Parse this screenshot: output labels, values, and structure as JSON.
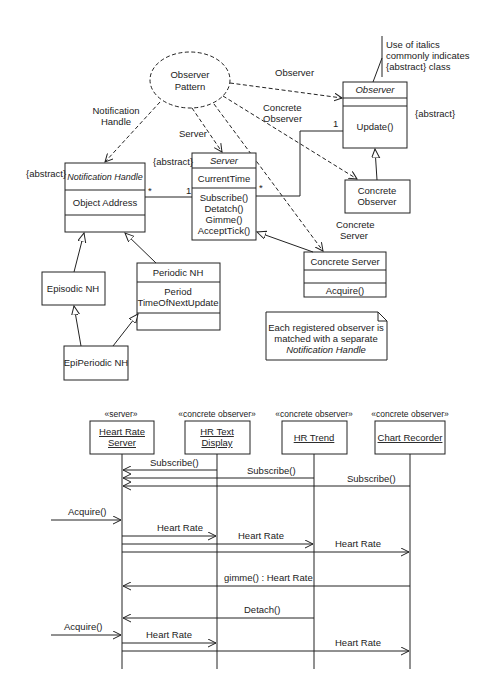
{
  "class_diagram": {
    "collaboration": {
      "label_line1": "Observer",
      "label_line2": "Pattern"
    },
    "role_labels": {
      "notification_handle_1": "Notification",
      "notification_handle_2": "Handle",
      "server": "Server",
      "observer": "Observer",
      "concrete_observer_1": "Concrete",
      "concrete_observer_2": "Observer",
      "concrete_server_1": "Concrete",
      "concrete_server_2": "Server"
    },
    "annotation": {
      "line1": "Use of italics",
      "line2": "commonly indicates",
      "line3": "{abstract} class"
    },
    "classes": {
      "observer": {
        "name": "Observer",
        "constraint": "{abstract}",
        "operations": [
          "Update()"
        ]
      },
      "notification_handle": {
        "name": "Notification Handle",
        "constraint": "{abstract}",
        "attributes": [
          "Object Address"
        ]
      },
      "server": {
        "name": "Server",
        "constraint": "{abstract}",
        "attributes": [
          "CurrentTime"
        ],
        "operations": [
          "Subscribe()",
          "Detatch()",
          "Gimme()",
          "AcceptTick()"
        ]
      },
      "concrete_observer": {
        "name_line1": "Concrete",
        "name_line2": "Observer"
      },
      "concrete_server": {
        "name": "Concrete Server",
        "operations": [
          "Acquire()"
        ]
      },
      "episodic_nh": {
        "name": "Episodic NH"
      },
      "periodic_nh": {
        "name": "Periodic NH",
        "attributes": [
          "Period",
          "TimeOfNextUpdate"
        ]
      },
      "epiperiodic_nh": {
        "name": "EpiPeriodic NH"
      }
    },
    "multiplicities": {
      "nh_server_left": "*",
      "nh_server_right": "1",
      "server_observer_left": "*",
      "server_observer_right": "1"
    },
    "note": {
      "line1": "Each registered observer is",
      "line2": "matched with a separate",
      "line3": "Notification Handle"
    }
  },
  "sequence_diagram": {
    "lifelines": [
      {
        "stereotype": "«server»",
        "name_line1": "Heart Rate",
        "name_line2": "Server"
      },
      {
        "stereotype": "«concrete observer»",
        "name_line1": "HR Text",
        "name_line2": "Display"
      },
      {
        "stereotype": "«concrete observer»",
        "name_line1": "HR Trend",
        "name_line2": ""
      },
      {
        "stereotype": "«concrete observer»",
        "name_line1": "Chart Recorder",
        "name_line2": ""
      }
    ],
    "messages": [
      {
        "label": "Subscribe()",
        "from": 1,
        "to": 0
      },
      {
        "label": "Subscribe()",
        "from": 2,
        "to": 0
      },
      {
        "label": "Subscribe()",
        "from": 3,
        "to": 0
      },
      {
        "label": "Acquire()",
        "from": "external",
        "to": 0
      },
      {
        "label": "Heart Rate",
        "from": 0,
        "to": 1
      },
      {
        "label": "Heart Rate",
        "from": 0,
        "to": 2
      },
      {
        "label": "Heart Rate",
        "from": 0,
        "to": 3
      },
      {
        "label": "gimme() : Heart Rate",
        "from": 3,
        "to": 0
      },
      {
        "label": "Detach()",
        "from": 2,
        "to": 0
      },
      {
        "label": "Acquire()",
        "from": "external",
        "to": 0
      },
      {
        "label": "Heart Rate",
        "from": 0,
        "to": 1
      },
      {
        "label": "Heart Rate",
        "from": 0,
        "to": 3
      }
    ]
  }
}
